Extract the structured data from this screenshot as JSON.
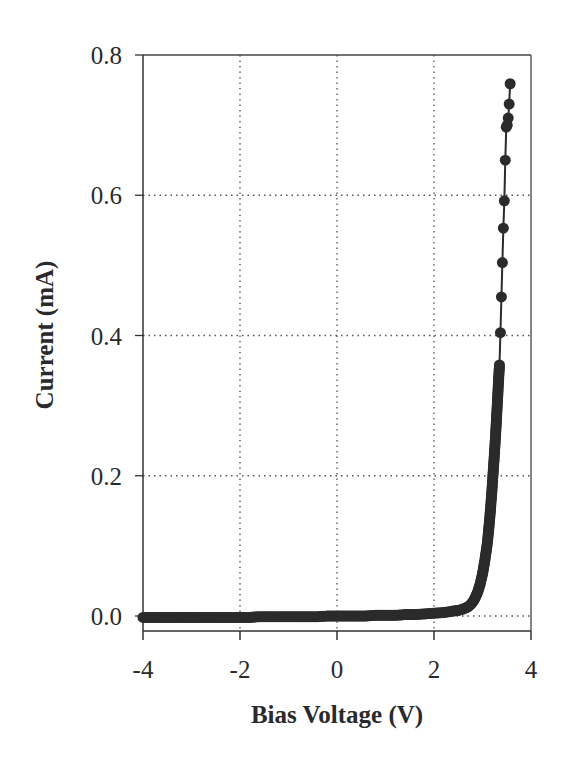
{
  "chart_data": {
    "type": "scatter",
    "title": "",
    "xlabel": "Bias Voltage (V)",
    "ylabel": "Current (mA)",
    "xlim": [
      -4,
      4
    ],
    "ylim": [
      0.0,
      0.8
    ],
    "x_ticks": [
      -4,
      -2,
      0,
      2,
      4
    ],
    "x_tick_labels": [
      "-4",
      "-2",
      "0",
      "2",
      "4"
    ],
    "y_ticks": [
      0.0,
      0.2,
      0.4,
      0.6,
      0.8
    ],
    "y_tick_labels": [
      "0.0",
      "0.2",
      "0.4",
      "0.6",
      "0.8"
    ],
    "grid": "dotted",
    "legend": null,
    "marker": "filled-circle",
    "line": "solid",
    "color": "#2b2b2b",
    "series": [
      {
        "name": "I-V",
        "x": [
          -4.0,
          -3.8,
          -3.6,
          -3.4,
          -3.2,
          -3.0,
          -2.8,
          -2.6,
          -2.4,
          -2.2,
          -2.0,
          -1.8,
          -1.6,
          -1.4,
          -1.2,
          -1.0,
          -0.8,
          -0.6,
          -0.4,
          -0.2,
          0.0,
          0.2,
          0.4,
          0.6,
          0.8,
          1.0,
          1.2,
          1.4,
          1.6,
          1.8,
          2.0,
          2.2,
          2.4,
          2.5,
          2.6,
          2.7,
          2.75,
          2.8,
          2.85,
          2.9,
          2.95,
          3.0,
          3.05,
          3.1,
          3.13,
          3.16,
          3.19,
          3.22,
          3.25,
          3.27,
          3.29,
          3.31,
          3.33,
          3.35,
          3.37,
          3.39,
          3.41,
          3.43,
          3.45,
          3.47,
          3.49,
          3.51,
          3.53,
          3.55,
          3.57
        ],
        "y": [
          -0.002,
          -0.002,
          -0.002,
          -0.002,
          -0.002,
          -0.002,
          -0.002,
          -0.002,
          -0.002,
          -0.002,
          -0.002,
          -0.002,
          -0.001,
          -0.001,
          -0.001,
          -0.001,
          -0.001,
          -0.001,
          -0.001,
          0.0,
          0.0,
          0.0,
          0.0,
          0.0,
          0.001,
          0.001,
          0.001,
          0.002,
          0.002,
          0.003,
          0.004,
          0.005,
          0.007,
          0.008,
          0.01,
          0.013,
          0.016,
          0.02,
          0.026,
          0.034,
          0.045,
          0.06,
          0.08,
          0.104,
          0.125,
          0.148,
          0.175,
          0.205,
          0.236,
          0.258,
          0.283,
          0.308,
          0.335,
          0.358,
          0.404,
          0.455,
          0.504,
          0.553,
          0.592,
          0.65,
          0.697,
          0.7,
          0.71,
          0.73,
          0.759
        ]
      }
    ]
  },
  "caption_fragment": "Fig. 2 — I-V characteristic of a high-brightness blue-emitting InGaN/GaN LED"
}
